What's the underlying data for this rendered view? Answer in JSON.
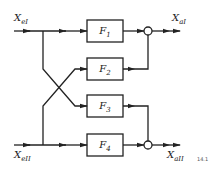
{
  "inputs": {
    "top": {
      "symbol": "X",
      "sub": "eI"
    },
    "bottom": {
      "symbol": "X",
      "sub": "eII"
    }
  },
  "outputs": {
    "top": {
      "symbol": "X",
      "sub": "aI"
    },
    "bottom": {
      "symbol": "X",
      "sub": "aII"
    }
  },
  "blocks": [
    {
      "label": "F",
      "sub": "1"
    },
    {
      "label": "F",
      "sub": "2"
    },
    {
      "label": "F",
      "sub": "3"
    },
    {
      "label": "F",
      "sub": "4"
    }
  ],
  "figure_tag": "14.1",
  "colors": {
    "line": "#222222",
    "background": "#ffffff"
  }
}
